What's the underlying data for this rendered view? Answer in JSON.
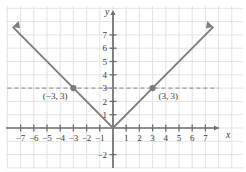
{
  "chart_data": {
    "type": "line",
    "title": "",
    "xlabel": "x",
    "ylabel": "y",
    "function": "y = |x|",
    "xlim": [
      -8,
      8
    ],
    "ylim": [
      -3,
      8
    ],
    "grid": true,
    "legend": "none",
    "x_ticks": [
      -7,
      -6,
      -5,
      -4,
      -3,
      -2,
      -1,
      1,
      2,
      3,
      4,
      5,
      6,
      7
    ],
    "x_tick_labels": [
      "−7",
      "−6",
      "−5",
      "−4",
      "−3",
      "−2",
      "−1",
      "1",
      "2",
      "3",
      "4",
      "5",
      "6",
      "7"
    ],
    "y_ticks": [
      -2,
      1,
      2,
      3,
      4,
      5,
      6,
      7
    ],
    "y_tick_labels": [
      "−2",
      "1",
      "2",
      "3",
      "4",
      "5",
      "6",
      "7"
    ],
    "series": [
      {
        "name": "y = |x|",
        "x": [
          -7.6,
          0,
          7.6
        ],
        "values": [
          7.6,
          0,
          7.6
        ],
        "style": "solid",
        "arrows": "both"
      },
      {
        "name": "y = 3",
        "x": [
          -8,
          8
        ],
        "values": [
          3,
          3
        ],
        "style": "dashed",
        "arrows": "none"
      }
    ],
    "points": [
      {
        "x": -3,
        "y": 3,
        "label": "(−3, 3)"
      },
      {
        "x": 3,
        "y": 3,
        "label": "(3, 3)"
      }
    ]
  },
  "colors": {
    "background": "#ffffff",
    "grid": "#e3e3e6",
    "axis": "#6e6e6e",
    "curve": "#7d7d82",
    "dashed": "#9a9aa0",
    "point": "#7a7a80",
    "text": "#3a3a3a"
  },
  "geometry": {
    "origin_x": 113,
    "origin_y": 128,
    "unit_x": 13.2,
    "unit_y": 13.3
  }
}
